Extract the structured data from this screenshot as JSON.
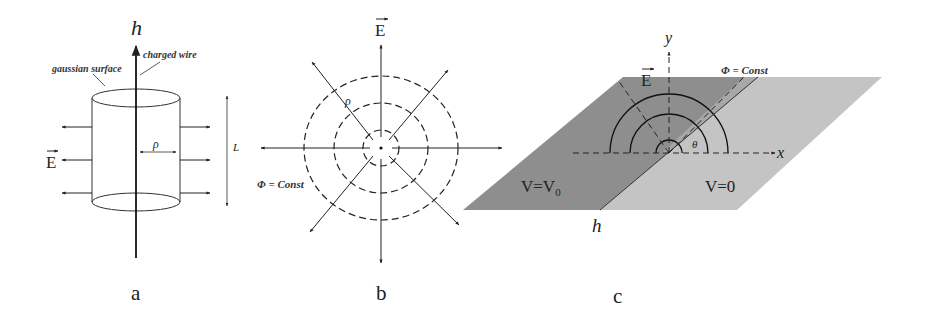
{
  "figure": {
    "panels": [
      {
        "id": "a",
        "caption": "a",
        "labels": {
          "axis": "h",
          "wire": "charged wire",
          "surface": "gaussian surface",
          "radius": "ρ",
          "length": "L",
          "field": "E"
        }
      },
      {
        "id": "b",
        "caption": "b",
        "labels": {
          "field": "E",
          "radius": "ρ",
          "equipotential": "Φ = Const"
        }
      },
      {
        "id": "c",
        "caption": "c",
        "labels": {
          "y_axis": "y",
          "x_axis": "x",
          "h_axis": "h",
          "field": "E",
          "equipotential": "Φ = Const",
          "angle": "θ",
          "left_region_V": "V=V",
          "left_region_sub": "0",
          "right_region": "V=0"
        },
        "colors": {
          "left_plane": "#8e8e8e",
          "right_plane": "#c4c4c4"
        }
      }
    ]
  }
}
